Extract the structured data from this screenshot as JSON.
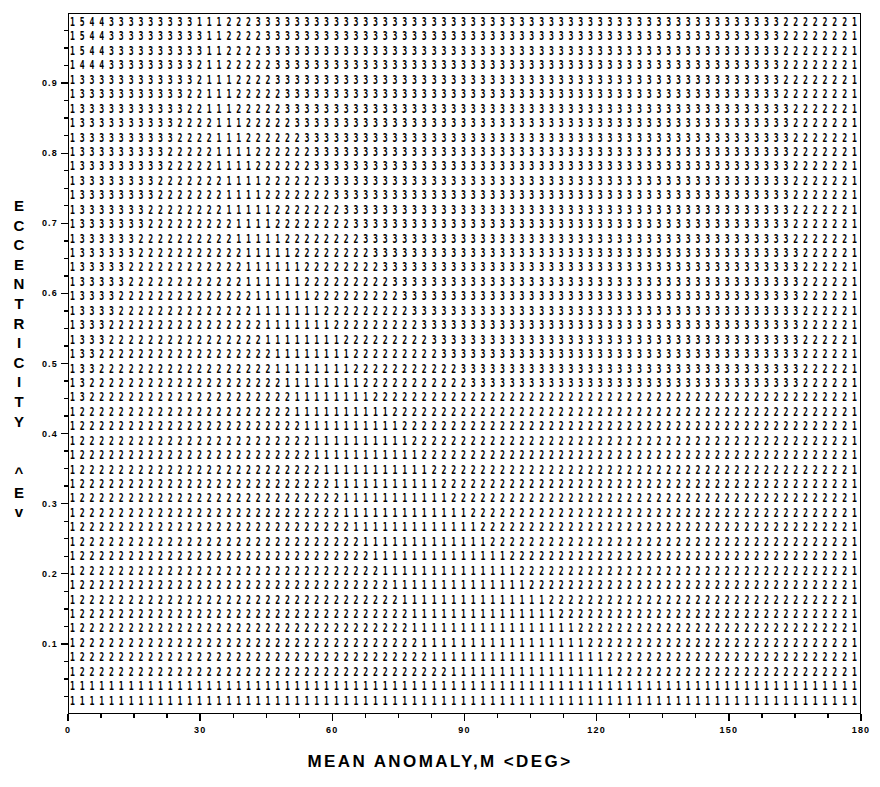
{
  "chart_data": {
    "type": "heatmap",
    "title": "",
    "subtitle": "",
    "xlabel": "MEAN ANOMALY,M <DEG>",
    "ylabel": "ECCENTRICITY <E>",
    "value_meaning": "number of iterations to converge",
    "grid": false,
    "legend": "none",
    "x": {
      "min": 0,
      "max": 180,
      "unit": "DEG",
      "major_ticks": [
        0,
        30,
        60,
        90,
        120,
        150,
        180
      ],
      "tick_labels": [
        "0",
        "30",
        "60",
        "90",
        "120",
        "150",
        "180"
      ],
      "minor_ticks_per_major": 3
    },
    "y": {
      "min": 0.0,
      "max": 1.0,
      "major_ticks": [
        0.1,
        0.2,
        0.3,
        0.4,
        0.5,
        0.6,
        0.7,
        0.8,
        0.9
      ],
      "tick_labels": [
        "0.1",
        "0.2",
        "0.3",
        "0.4",
        "0.5",
        "0.6",
        "0.7",
        "0.8",
        "0.9"
      ],
      "minor_ticks_per_major": 3
    },
    "grid_shape": {
      "columns": 81,
      "rows": 48
    },
    "value_range": {
      "min": 1,
      "max": 5
    },
    "observed_samples": {
      "top_row_left": "1544333332222221111112222222222",
      "row2_left": "1443333322222221111112222222222",
      "bottom_row": "111111111111111111111111111111",
      "right_edge_digit": "1"
    }
  },
  "axis": {
    "x_title": "MEAN ANOMALY,M <DEG>",
    "y_title_chars": [
      "E",
      "C",
      "C",
      "E",
      "N",
      "T",
      "R",
      "I",
      "C",
      "I",
      "T",
      "Y"
    ],
    "y_unit_chars": [
      "^",
      "E",
      "v"
    ],
    "x_tick_labels": [
      "0",
      "30",
      "60",
      "90",
      "120",
      "150",
      "180"
    ],
    "y_tick_labels": [
      "0.9",
      "0.8",
      "0.7",
      "0.6",
      "0.5",
      "0.4",
      "0.3",
      "0.2",
      "0.1"
    ]
  },
  "style": {
    "ink_color": "#000000",
    "background_color": "#ffffff"
  }
}
